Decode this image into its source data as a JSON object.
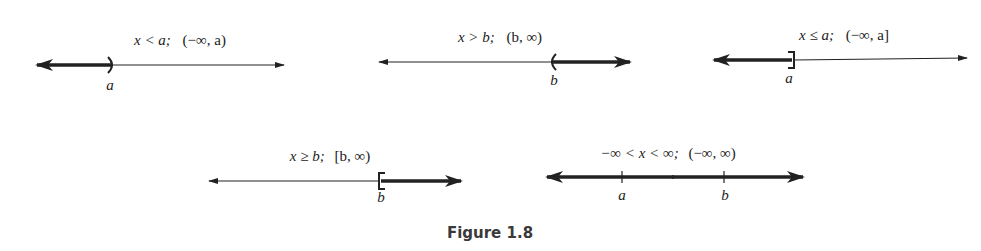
{
  "figure": {
    "caption": "Figure 1.8",
    "colors": {
      "ink": "#222222",
      "caption": "#3a3a3a",
      "background": "#ffffff"
    }
  },
  "number_lines": [
    {
      "id": "x-less-than-a",
      "inequality": "x < a;",
      "interval": "(−∞, a)",
      "endpoint_label": "a",
      "endpoint_symbol": ")",
      "shaded_direction": "left",
      "endpoint_included": false
    },
    {
      "id": "x-greater-than-b",
      "inequality": "x > b;",
      "interval": "(b, ∞)",
      "endpoint_label": "b",
      "endpoint_symbol": "(",
      "shaded_direction": "right",
      "endpoint_included": false
    },
    {
      "id": "x-less-equal-a",
      "inequality": "x ≤ a;",
      "interval": "(−∞, a]",
      "endpoint_label": "a",
      "endpoint_symbol": "]",
      "shaded_direction": "left",
      "endpoint_included": true
    },
    {
      "id": "x-greater-equal-b",
      "inequality": "x ≥ b;",
      "interval": "[b, ∞)",
      "endpoint_label": "b",
      "endpoint_symbol": "[",
      "shaded_direction": "right",
      "endpoint_included": true
    },
    {
      "id": "all-reals",
      "inequality": "−∞ < x < ∞;",
      "interval": "(−∞, ∞)",
      "tick_labels": [
        "a",
        "b"
      ],
      "shaded_direction": "both",
      "endpoint_included": null
    }
  ]
}
